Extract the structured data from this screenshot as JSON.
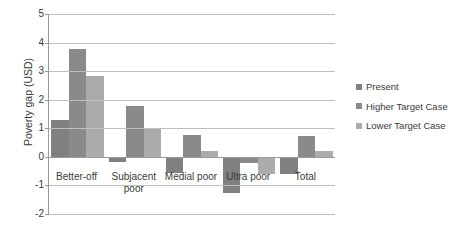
{
  "chart_data": {
    "type": "bar",
    "title": "",
    "subtitle": "",
    "xlabel": "",
    "ylabel": "Poverty gap (USD)",
    "categories": [
      "Better-off",
      "Subjacent poor",
      "Medial poor",
      "Ultra poor",
      "Total"
    ],
    "series": [
      {
        "name": "Present",
        "color": "#808080",
        "values": [
          1.28,
          -0.18,
          -0.55,
          -1.25,
          -0.6
        ]
      },
      {
        "name": "Higher Target Case",
        "color": "#8a8a8a",
        "values": [
          3.78,
          1.78,
          0.75,
          -0.2,
          0.72
        ]
      },
      {
        "name": "Lower Target Case",
        "color": "#ababab",
        "values": [
          2.82,
          1.0,
          0.2,
          -0.6,
          0.2
        ]
      }
    ],
    "ylim": [
      -2,
      5
    ],
    "ytick_step": 1,
    "yticks": [
      "5",
      "4",
      "3",
      "2",
      "1",
      "0",
      "-1",
      "-2"
    ],
    "grid": true,
    "legend_position": "right",
    "orientation": "vertical"
  },
  "axis": {
    "y_title": "Poverty gap (USD)"
  },
  "legend": {
    "items": [
      {
        "label": "Present"
      },
      {
        "label": "Higher Target Case"
      },
      {
        "label": "Lower Target Case"
      }
    ]
  },
  "x_labels": [
    {
      "line1": "Better-off",
      "line2": ""
    },
    {
      "line1": "Subjacent",
      "line2": "poor"
    },
    {
      "line1": "Medial poor",
      "line2": ""
    },
    {
      "line1": "Ultra poor",
      "line2": ""
    },
    {
      "line1": "Total",
      "line2": ""
    }
  ],
  "colors": {
    "gridline": "#bfbfbf",
    "axis": "#9a9a9a",
    "text": "#3a3a3a",
    "background": "#ffffff"
  }
}
